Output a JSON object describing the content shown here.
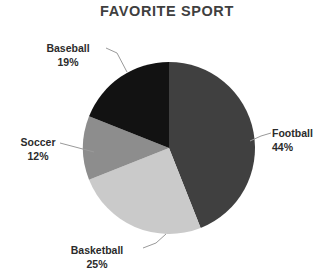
{
  "chart_data": {
    "type": "pie",
    "title": "FAVORITE SPORT",
    "categories": [
      "Football",
      "Basketball",
      "Soccer",
      "Baseball"
    ],
    "values": [
      44,
      25,
      12,
      19
    ],
    "value_unit": "%",
    "labels": [
      {
        "name": "Football",
        "percent": "44%",
        "value": 44,
        "color": "#404040"
      },
      {
        "name": "Basketball",
        "percent": "25%",
        "value": 25,
        "color": "#cacaca"
      },
      {
        "name": "Soccer",
        "percent": "12%",
        "value": 12,
        "color": "#8d8d8d"
      },
      {
        "name": "Baseball",
        "percent": "19%",
        "value": 19,
        "color": "#121212"
      }
    ],
    "legend": "none",
    "labels_position": "outside-with-leader-lines",
    "start_angle_deg": 0,
    "direction": "clockwise",
    "grid": false,
    "xlabel": "",
    "ylabel": ""
  },
  "slices": {
    "football": {
      "label": "Football",
      "percent": "44%"
    },
    "basketball": {
      "label": "Basketball",
      "percent": "25%"
    },
    "soccer": {
      "label": "Soccer",
      "percent": "12%"
    },
    "baseball": {
      "label": "Baseball",
      "percent": "19%"
    }
  }
}
